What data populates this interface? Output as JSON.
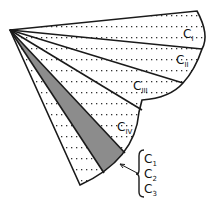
{
  "diagram": {
    "colors": {
      "stroke": "#1a1a1a",
      "shade": "#8c8c8c",
      "dots": "#333333",
      "background": "#ffffff"
    },
    "sectors": [
      {
        "id": "CI",
        "label": "C",
        "sub": "I"
      },
      {
        "id": "CII",
        "label": "C",
        "sub": "II"
      },
      {
        "id": "CIII",
        "label": "C",
        "sub": "III"
      },
      {
        "id": "CIV",
        "label": "C",
        "sub": "IV"
      }
    ],
    "callout": {
      "items": [
        {
          "label": "C",
          "sub": "1"
        },
        {
          "label": "C",
          "sub": "2"
        },
        {
          "label": "C",
          "sub": "3"
        }
      ]
    }
  }
}
